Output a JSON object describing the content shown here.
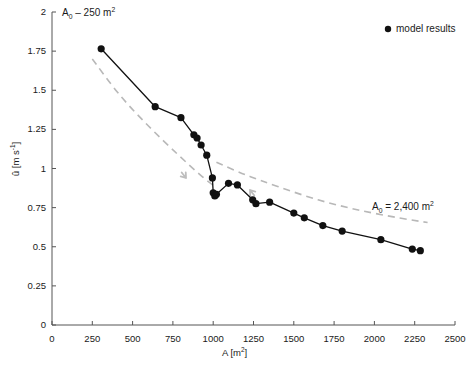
{
  "chart_data": {
    "type": "line",
    "title": "",
    "xlabel": "A [m2]",
    "ylabel": "û [m s-1]",
    "xlim": [
      0,
      2500
    ],
    "ylim": [
      0,
      2
    ],
    "xticks": [
      0,
      250,
      500,
      750,
      1000,
      1250,
      1500,
      1750,
      2000,
      2250,
      2500
    ],
    "yticks": [
      0,
      0.25,
      0.5,
      0.75,
      1,
      1.25,
      1.5,
      1.75,
      2
    ],
    "grid": false,
    "legend_position": "top-right",
    "series": [
      {
        "name": "model results",
        "style": "solid-markers",
        "color": "#111111",
        "points": [
          [
            305,
            1.765
          ],
          [
            640,
            1.395
          ],
          [
            800,
            1.325
          ],
          [
            880,
            1.215
          ],
          [
            900,
            1.195
          ],
          [
            925,
            1.15
          ],
          [
            960,
            1.085
          ],
          [
            995,
            0.94
          ],
          [
            1000,
            0.845
          ],
          [
            1010,
            0.825
          ],
          [
            1020,
            0.835
          ],
          [
            1095,
            0.905
          ],
          [
            1150,
            0.895
          ],
          [
            1245,
            0.8
          ],
          [
            1265,
            0.775
          ],
          [
            1350,
            0.785
          ],
          [
            1500,
            0.715
          ],
          [
            1565,
            0.685
          ],
          [
            1680,
            0.635
          ],
          [
            1800,
            0.6
          ],
          [
            2040,
            0.545
          ],
          [
            2235,
            0.485
          ],
          [
            2285,
            0.475
          ]
        ]
      },
      {
        "name": "A0 - 250 m2 reference",
        "style": "dashed",
        "color": "#b8b8b8",
        "points": [
          [
            250,
            1.7
          ],
          [
            420,
            1.47
          ],
          [
            600,
            1.27
          ],
          [
            780,
            1.09
          ],
          [
            930,
            0.95
          ],
          [
            1010,
            0.885
          ]
        ]
      },
      {
        "name": "A0 = 2,400 m2 reference",
        "style": "dashed",
        "color": "#b8b8b8",
        "points": [
          [
            1020,
            1.04
          ],
          [
            1200,
            0.96
          ],
          [
            1400,
            0.885
          ],
          [
            1650,
            0.8
          ],
          [
            1900,
            0.735
          ],
          [
            2150,
            0.685
          ],
          [
            2330,
            0.655
          ]
        ]
      }
    ],
    "annotations": [
      {
        "name": "left-curve-label",
        "text_main": "A",
        "text_sub": "0",
        "text_rest": " – 250 m",
        "text_sup": "2",
        "x_px": 62,
        "y_px": 14
      },
      {
        "name": "right-curve-label",
        "text_main": "A",
        "text_sub": "0",
        "text_rest": " = 2,400 m",
        "text_sup": "2",
        "x_px": 372,
        "y_px": 208
      }
    ],
    "arrows": [
      {
        "name": "left-curve-arrow",
        "direction": "down-right",
        "x_px": 186,
        "y_px": 178
      },
      {
        "name": "right-curve-arrow",
        "direction": "up-left",
        "x_px": 250,
        "y_px": 190
      }
    ]
  },
  "legend": {
    "marker_label": "model results",
    "marker_color": "#111111"
  },
  "axes": {
    "x_label_main": "A [m",
    "x_label_sup": "2",
    "x_label_close": "]",
    "y_label_u": "û",
    "y_label_unit_main": " [m s",
    "y_label_unit_sup": "-1",
    "y_label_unit_close": "]",
    "x_tick_labels": [
      "0",
      "250",
      "500",
      "750",
      "1000",
      "1250",
      "1500",
      "1750",
      "2000",
      "2250",
      "2500"
    ],
    "y_tick_labels": [
      "0",
      "0.25",
      "0.5",
      "0.75",
      "1",
      "1.25",
      "1.5",
      "1.75",
      "2"
    ]
  },
  "colors": {
    "axis": "#555555",
    "data": "#111111",
    "reference": "#bdbdbd",
    "text": "#1a1a1a"
  }
}
